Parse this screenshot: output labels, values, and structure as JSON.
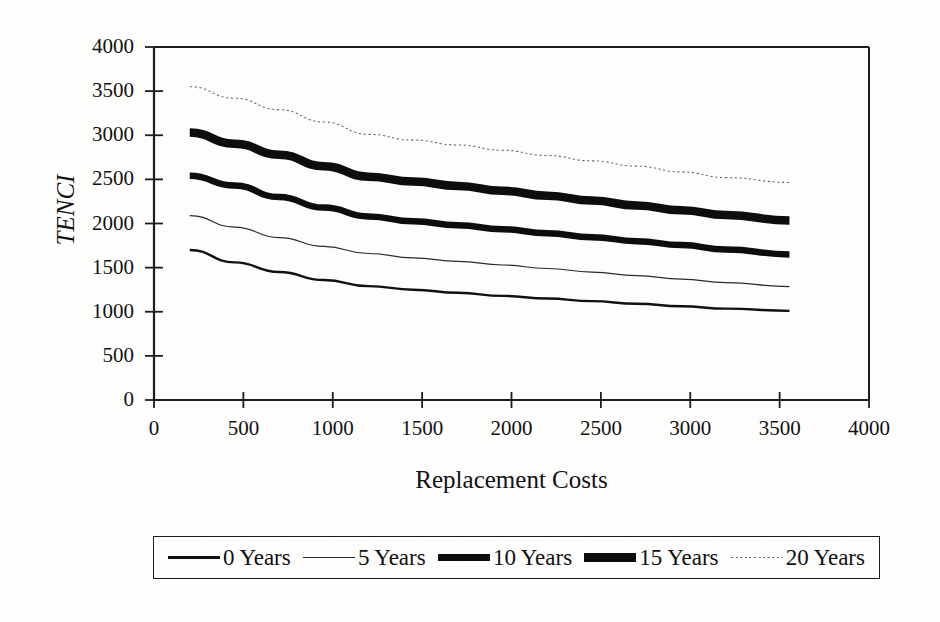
{
  "chart_data": {
    "type": "line",
    "title": "",
    "xlabel": "Replacement Costs",
    "ylabel": "TENCI",
    "xlim": [
      0,
      4000
    ],
    "ylim": [
      0,
      4000
    ],
    "xticks": [
      "0",
      "500",
      "1000",
      "1500",
      "2000",
      "2500",
      "3000",
      "3500",
      "4000"
    ],
    "yticks": [
      "0",
      "500",
      "1000",
      "1500",
      "2000",
      "2500",
      "3000",
      "3500",
      "4000"
    ],
    "xtick_values": [
      0,
      500,
      1000,
      1500,
      2000,
      2500,
      3000,
      3500,
      4000
    ],
    "ytick_values": [
      0,
      500,
      1000,
      1500,
      2000,
      2500,
      3000,
      3500,
      4000
    ],
    "grid": false,
    "legend_position": "bottom",
    "x": [
      200,
      450,
      700,
      950,
      1200,
      1450,
      1700,
      1950,
      2200,
      2450,
      2700,
      2950,
      3200,
      3555
    ],
    "series": [
      {
        "name": "0 Years",
        "style": "solid",
        "line_width": 2.4,
        "color": "#111111",
        "values": [
          1700,
          1560,
          1450,
          1360,
          1290,
          1250,
          1215,
          1180,
          1150,
          1120,
          1090,
          1062,
          1035,
          1010
        ]
      },
      {
        "name": "5 Years",
        "style": "solid",
        "line_width": 1.2,
        "color": "#2a2a2a",
        "values": [
          2090,
          1960,
          1840,
          1740,
          1660,
          1610,
          1570,
          1530,
          1490,
          1450,
          1410,
          1370,
          1330,
          1285
        ]
      },
      {
        "name": "10 Years",
        "style": "solid",
        "line_width": 6.5,
        "color": "#0d0d0d",
        "values": [
          2540,
          2430,
          2300,
          2180,
          2080,
          2025,
          1980,
          1935,
          1890,
          1845,
          1800,
          1755,
          1705,
          1650
        ]
      },
      {
        "name": "15 Years",
        "style": "solid",
        "line_width": 8.5,
        "color": "#0d0d0d",
        "values": [
          3030,
          2905,
          2780,
          2650,
          2530,
          2475,
          2425,
          2370,
          2315,
          2260,
          2205,
          2150,
          2095,
          2035
        ]
      },
      {
        "name": "20 Years",
        "style": "dotted",
        "line_width": 1.1,
        "color": "#6a6a6a",
        "values": [
          3550,
          3420,
          3290,
          3150,
          3010,
          2945,
          2890,
          2830,
          2770,
          2710,
          2650,
          2585,
          2520,
          2465
        ]
      }
    ]
  },
  "legend": {
    "items": [
      {
        "label": "0 Years",
        "swatch": "line-medium-swatch"
      },
      {
        "label": "5 Years",
        "swatch": "line-thin-swatch"
      },
      {
        "label": "10 Years",
        "swatch": "line-thick-swatch"
      },
      {
        "label": "15 Years",
        "swatch": "line-thicker-swatch"
      },
      {
        "label": "20 Years",
        "swatch": "line-dotted-swatch"
      }
    ]
  }
}
